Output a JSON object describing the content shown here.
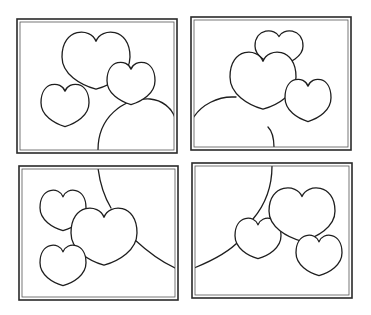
{
  "page": {
    "colors": {
      "background": "#ffffff",
      "line": "#1e1e1e",
      "frame": "#2a2a2a"
    }
  },
  "panels": [
    {
      "id": "top-left",
      "frame": {
        "x": 17,
        "y": 19,
        "w": 160,
        "h": 134
      },
      "arcs": [
        "M98,150 C98,118 122,98 150,99 C162,100 172,108 175,118"
      ],
      "hearts": [
        {
          "name": "large-heart",
          "cx": 96,
          "cy": 60,
          "w": 68,
          "h": 62
        },
        {
          "name": "right-heart",
          "cx": 131,
          "cy": 83,
          "w": 48,
          "h": 46
        },
        {
          "name": "left-heart",
          "cx": 65,
          "cy": 105,
          "w": 48,
          "h": 46
        }
      ]
    },
    {
      "id": "top-right",
      "frame": {
        "x": 191,
        "y": 17,
        "w": 160,
        "h": 133
      },
      "arcs": [
        "M193,118 C202,104 218,97 232,97 L236,97",
        "M268,127 C273,132 274,140 274,148"
      ],
      "hearts": [
        {
          "name": "top-heart",
          "cx": 279,
          "cy": 48,
          "w": 48,
          "h": 38
        },
        {
          "name": "large-heart",
          "cx": 263,
          "cy": 80,
          "w": 66,
          "h": 62
        },
        {
          "name": "right-heart",
          "cx": 308,
          "cy": 100,
          "w": 46,
          "h": 46
        }
      ]
    },
    {
      "id": "bottom-left",
      "frame": {
        "x": 19,
        "y": 166,
        "w": 159,
        "h": 134
      },
      "arcs": [
        "M98,168 C100,184 105,198 111,208",
        "M135,240 C148,252 162,262 175,268"
      ],
      "hearts": [
        {
          "name": "top-left-heart",
          "cx": 63,
          "cy": 210,
          "w": 46,
          "h": 44
        },
        {
          "name": "large-heart",
          "cx": 104,
          "cy": 236,
          "w": 66,
          "h": 62
        },
        {
          "name": "bottom-left-heart",
          "cx": 63,
          "cy": 265,
          "w": 46,
          "h": 44
        }
      ]
    },
    {
      "id": "bottom-right",
      "frame": {
        "x": 192,
        "y": 163,
        "w": 160,
        "h": 135
      },
      "arcs": [
        "M272,166 C272,190 264,206 253,219",
        "M194,268 C214,260 230,251 240,240"
      ],
      "hearts": [
        {
          "name": "left-heart",
          "cx": 258,
          "cy": 238,
          "w": 46,
          "h": 44
        },
        {
          "name": "large-heart",
          "cx": 302,
          "cy": 214,
          "w": 66,
          "h": 58
        },
        {
          "name": "right-heart",
          "cx": 319,
          "cy": 255,
          "w": 46,
          "h": 44
        }
      ]
    }
  ]
}
